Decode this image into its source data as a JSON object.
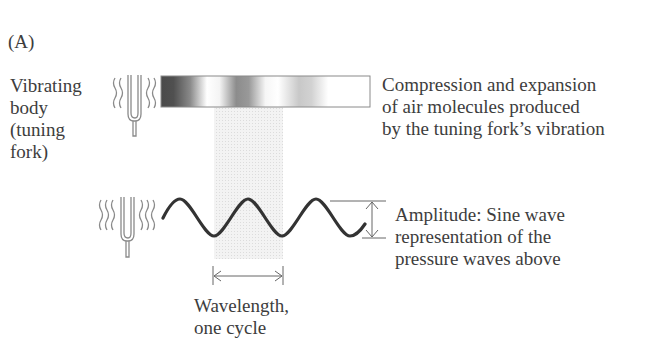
{
  "figure": {
    "panel_label": "(A)",
    "vibrating_body_label": [
      "Vibrating",
      "body",
      "(tuning",
      "fork)"
    ],
    "compression_label": [
      "Compression and expansion",
      "of air molecules produced",
      "by the tuning fork’s vibration"
    ],
    "amplitude_label": [
      "Amplitude: Sine wave",
      "representation of the",
      "pressure waves above"
    ],
    "wavelength_label": [
      "Wavelength,",
      "one cycle"
    ],
    "icons": {
      "top_fork": "tuning-fork-icon",
      "bottom_fork": "tuning-fork-icon"
    },
    "colors": {
      "text": "#3d3d3d",
      "wave": "#333333",
      "fork": "#888888",
      "band": "#e6e6e6",
      "bar_border": "#8a8a8a"
    }
  }
}
